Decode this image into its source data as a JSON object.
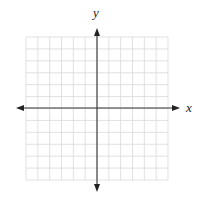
{
  "diagram": {
    "type": "coordinate-plane",
    "x_axis_label": "x",
    "y_axis_label": "y",
    "grid": {
      "columns": 12,
      "rows": 12,
      "cells_left_of_y_axis": 6,
      "cells_right_of_y_axis": 6,
      "cells_above_x_axis": 6,
      "cells_below_x_axis": 6,
      "line_color": "#d9d9d9",
      "axis_color": "#333333"
    },
    "arrows": [
      "left",
      "right",
      "up",
      "down"
    ]
  }
}
